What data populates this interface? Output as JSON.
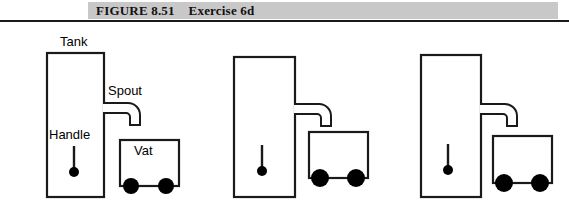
{
  "figure": {
    "band_color": "#c8c8c8",
    "rule_color": "#1a1a1a",
    "caption": "FIGURE 8.51    Exercise 6d",
    "number": "FIGURE 8.51",
    "title": "Exercise 6d"
  },
  "labels": {
    "tank": "Tank",
    "spout": "Spout",
    "handle": "Handle",
    "vat": "Vat"
  },
  "colors": {
    "stroke": "#1a1a1a",
    "fill": "#ffffff",
    "wheel": "#000000",
    "text": "#000000"
  },
  "diagrams": [
    {
      "name": "panel-1-labeled",
      "labeled": true,
      "tank": {
        "x": 46,
        "y": 52,
        "w": 57,
        "h": 144
      },
      "spout": {
        "x": 103,
        "y": 103,
        "w": 37,
        "h": 22
      },
      "handle": {
        "x": 74,
        "y": 146,
        "len": 22,
        "knob_r": 5
      },
      "vat": {
        "x": 119,
        "y": 139,
        "w": 59,
        "h": 46
      },
      "wheels": [
        {
          "cx": 131,
          "cy": 186,
          "r": 8
        },
        {
          "cx": 166,
          "cy": 186,
          "r": 8
        }
      ]
    },
    {
      "name": "panel-2",
      "labeled": false,
      "tank": {
        "x": 233,
        "y": 56,
        "w": 61,
        "h": 140
      },
      "spout": {
        "x": 294,
        "y": 104,
        "w": 37,
        "h": 22
      },
      "handle": {
        "x": 262,
        "y": 145,
        "len": 22,
        "knob_r": 5
      },
      "vat": {
        "x": 308,
        "y": 131,
        "w": 59,
        "h": 46
      },
      "wheels": [
        {
          "cx": 320,
          "cy": 178,
          "r": 9
        },
        {
          "cx": 356,
          "cy": 178,
          "r": 9
        }
      ]
    },
    {
      "name": "panel-3",
      "labeled": false,
      "tank": {
        "x": 420,
        "y": 54,
        "w": 60,
        "h": 142
      },
      "spout": {
        "x": 480,
        "y": 104,
        "w": 37,
        "h": 22
      },
      "handle": {
        "x": 448,
        "y": 144,
        "len": 22,
        "knob_r": 5
      },
      "vat": {
        "x": 492,
        "y": 135,
        "w": 59,
        "h": 47
      },
      "wheels": [
        {
          "cx": 504,
          "cy": 183,
          "r": 9
        },
        {
          "cx": 540,
          "cy": 183,
          "r": 9
        }
      ]
    }
  ]
}
